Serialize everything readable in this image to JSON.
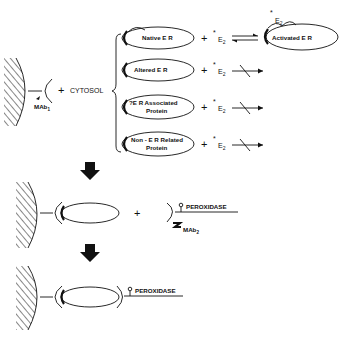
{
  "diagram": {
    "step1": {
      "antibody_label": "MAb",
      "antibody_sub": "1",
      "plus": "+",
      "cytosol_label": "CYTOSOL",
      "branches": [
        {
          "label_lines": [
            "Native E R"
          ],
          "reagent": "E",
          "reagent_sub": "2",
          "reagent_star": "*",
          "reaction": "reversible",
          "product": "Activated E R",
          "product_tag": "E",
          "product_tag_sub": "2",
          "product_tag_star": "*"
        },
        {
          "label_lines": [
            "Altered E R"
          ],
          "reagent": "E",
          "reagent_sub": "2",
          "reagent_star": "*",
          "reaction": "blocked"
        },
        {
          "label_lines": [
            "?E R Associated",
            "Protein"
          ],
          "reagent": "E",
          "reagent_sub": "2",
          "reagent_star": "*",
          "reaction": "blocked"
        },
        {
          "label_lines": [
            "Non - E R Related",
            "Protein"
          ],
          "reagent": "E",
          "reagent_sub": "2",
          "reagent_star": "*",
          "reaction": "blocked"
        }
      ]
    },
    "step2": {
      "plus": "+",
      "enzyme_label": "PEROXIDASE",
      "antibody_label": "MAb",
      "antibody_sub": "2"
    },
    "step3": {
      "enzyme_label": "PEROXIDASE"
    }
  }
}
